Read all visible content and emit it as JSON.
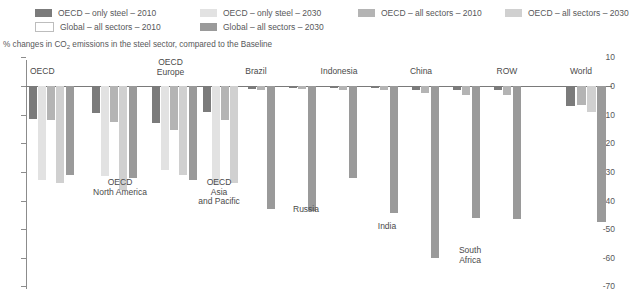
{
  "legend": {
    "items": [
      {
        "label": "OECD – only steel – 2010",
        "color": "#7b7b7b",
        "row": 1,
        "x": 35
      },
      {
        "label": "OECD – only steel – 2030",
        "color": "#e2e2e2",
        "row": 1,
        "x": 200
      },
      {
        "label": "OECD – all sectors – 2010",
        "color": "#b4b4b4",
        "row": 1,
        "x": 358
      },
      {
        "label": "OECD – all sectors – 2030",
        "color": "#d0d0d0",
        "row": 1,
        "x": 505
      },
      {
        "label": "Global – all sectors – 2010",
        "color": "#ffffff",
        "row": 2,
        "x": 35
      },
      {
        "label": "Global – all sectors – 2030",
        "color": "#9a9a9a",
        "row": 2,
        "x": 200
      }
    ]
  },
  "subtitle_pre": "% changes in CO",
  "subtitle_sub": "2",
  "subtitle_post": " emissions in the steel sector, compared to the Baseline",
  "chart_data": {
    "type": "bar",
    "title": "% changes in CO2 emissions in the steel sector, compared to the Baseline",
    "xlabel": "",
    "ylabel": "",
    "ylim": [
      -70,
      10
    ],
    "grid": false,
    "legend_position": "top",
    "yticks": [
      10,
      0,
      -10,
      -20,
      -30,
      -40,
      -50,
      -60,
      -70
    ],
    "ytick_labels": [
      "10",
      "0",
      "-10",
      "-20",
      "-30",
      "-40",
      "-50",
      "-60",
      "-70"
    ],
    "categories": [
      "OECD",
      "OECD\nNorth America",
      "OECD\nEurope",
      "OECD\nAsia\nand Pacific",
      "Brazil",
      "Russia",
      "Indonesia",
      "India",
      "China",
      "South\nAfrica",
      "ROW",
      "World"
    ],
    "series": [
      {
        "name": "OECD – only steel – 2010",
        "color": "#7b7b7b",
        "values": [
          -11.5,
          -9.5,
          -13.0,
          -9.0,
          -0.6,
          0.0,
          -0.5,
          0.0,
          -0.5,
          0.0,
          -0.4,
          -7.0
        ]
      },
      {
        "name": "OECD – only steel – 2030",
        "color": "#e2e2e2",
        "values": [
          -33.0,
          -31.5,
          -29.5,
          -34.5,
          -0.3,
          0.0,
          -0.2,
          0.0,
          -0.3,
          0.0,
          -0.3,
          -2.5
        ]
      },
      {
        "name": "OECD – all sectors – 2010",
        "color": "#b4b4b4",
        "values": [
          -12.0,
          -12.5,
          -15.5,
          -12.0,
          -0.8,
          0.0,
          -0.7,
          0.0,
          -0.6,
          0.0,
          -1.5,
          -6.5
        ]
      },
      {
        "name": "OECD – all sectors – 2030",
        "color": "#d0d0d0",
        "values": [
          -34.0,
          -36.5,
          -31.0,
          -34.0,
          -0.5,
          0.0,
          -0.4,
          0.0,
          -0.5,
          0.0,
          -2.5,
          -9.0
        ]
      },
      {
        "name": "Global – all sectors – 2010",
        "color": "#ffffff",
        "values": [
          -31.0,
          -31.0,
          -31.0,
          -31.0,
          -43.0,
          0.0,
          -32.0,
          0.0,
          -60.0,
          0.0,
          -46.5,
          -47.5
        ]
      },
      {
        "name": "Global – all sectors – 2030",
        "color": "#9a9a9a",
        "values": [
          -31.0,
          -31.0,
          -31.0,
          -31.0,
          -43.0,
          0.0,
          -32.0,
          0.0,
          -60.0,
          0.0,
          -46.5,
          -47.5
        ]
      }
    ],
    "bars": [
      {
        "group": "OECD",
        "series": "OECD – only steel – 2010",
        "value": -11.5,
        "x": 29,
        "w": 8,
        "color": "#7b7b7b"
      },
      {
        "group": "OECD",
        "series": "OECD – only steel – 2030",
        "value": -33.0,
        "x": 38,
        "w": 8,
        "color": "#e2e2e2"
      },
      {
        "group": "OECD",
        "series": "OECD – all sectors – 2010",
        "value": -12.0,
        "x": 47,
        "w": 8,
        "color": "#b4b4b4"
      },
      {
        "group": "OECD",
        "series": "OECD – all sectors – 2030",
        "value": -34.0,
        "x": 56,
        "w": 8,
        "color": "#d0d0d0"
      },
      {
        "group": "OECD",
        "series": "Global – all sectors – 2030",
        "value": -31.0,
        "x": 66,
        "w": 8,
        "color": "#9a9a9a"
      },
      {
        "group": "OECD North America",
        "series": "OECD – only steel – 2010",
        "value": -9.5,
        "x": 92,
        "w": 8,
        "color": "#7b7b7b"
      },
      {
        "group": "OECD North America",
        "series": "OECD – only steel – 2030",
        "value": -31.5,
        "x": 101,
        "w": 8,
        "color": "#e2e2e2"
      },
      {
        "group": "OECD North America",
        "series": "OECD – all sectors – 2010",
        "value": -12.5,
        "x": 110,
        "w": 8,
        "color": "#b4b4b4"
      },
      {
        "group": "OECD North America",
        "series": "OECD – all sectors – 2030",
        "value": -36.5,
        "x": 119,
        "w": 8,
        "color": "#d0d0d0"
      },
      {
        "group": "OECD North America",
        "series": "Global – all sectors – 2030",
        "value": -32.0,
        "x": 129,
        "w": 8,
        "color": "#9a9a9a"
      },
      {
        "group": "OECD Europe",
        "series": "OECD – only steel – 2010",
        "value": -13.0,
        "x": 152,
        "w": 8,
        "color": "#7b7b7b"
      },
      {
        "group": "OECD Europe",
        "series": "OECD – only steel – 2030",
        "value": -29.5,
        "x": 161,
        "w": 8,
        "color": "#e2e2e2"
      },
      {
        "group": "OECD Europe",
        "series": "OECD – all sectors – 2010",
        "value": -15.5,
        "x": 170,
        "w": 8,
        "color": "#b4b4b4"
      },
      {
        "group": "OECD Europe",
        "series": "OECD – all sectors – 2030",
        "value": -31.0,
        "x": 179,
        "w": 8,
        "color": "#d0d0d0"
      },
      {
        "group": "OECD Europe",
        "series": "Global – all sectors – 2030",
        "value": -33.0,
        "x": 189,
        "w": 8,
        "color": "#9a9a9a"
      },
      {
        "group": "OECD Asia and Pacific",
        "series": "OECD – only steel – 2010",
        "value": -9.0,
        "x": 203,
        "w": 8,
        "color": "#7b7b7b"
      },
      {
        "group": "OECD Asia and Pacific",
        "series": "OECD – only steel – 2030",
        "value": -34.5,
        "x": 212,
        "w": 8,
        "color": "#e2e2e2"
      },
      {
        "group": "OECD Asia and Pacific",
        "series": "OECD – all sectors – 2010",
        "value": -12.0,
        "x": 221,
        "w": 8,
        "color": "#b4b4b4"
      },
      {
        "group": "OECD Asia and Pacific",
        "series": "OECD – all sectors – 2030",
        "value": -34.0,
        "x": 230,
        "w": 8,
        "color": "#d0d0d0"
      },
      {
        "group": "Brazil",
        "series": "OECD – only steel – 2010",
        "value": -1.0,
        "x": 248,
        "w": 8,
        "color": "#7b7b7b"
      },
      {
        "group": "Brazil",
        "series": "OECD – all sectors – 2010",
        "value": -1.5,
        "x": 257,
        "w": 8,
        "color": "#b4b4b4"
      },
      {
        "group": "Brazil",
        "series": "Global – all sectors – 2030",
        "value": -43.0,
        "x": 267,
        "w": 8,
        "color": "#9a9a9a"
      },
      {
        "group": "Russia",
        "series": "OECD – only steel – 2010",
        "value": -0.8,
        "x": 289,
        "w": 8,
        "color": "#7b7b7b"
      },
      {
        "group": "Russia",
        "series": "OECD – all sectors – 2010",
        "value": -1.2,
        "x": 298,
        "w": 8,
        "color": "#b4b4b4"
      },
      {
        "group": "Russia",
        "series": "Global – all sectors – 2030",
        "value": -43.5,
        "x": 308,
        "w": 8,
        "color": "#9a9a9a"
      },
      {
        "group": "Indonesia",
        "series": "OECD – only steel – 2010",
        "value": -0.8,
        "x": 330,
        "w": 8,
        "color": "#7b7b7b"
      },
      {
        "group": "Indonesia",
        "series": "OECD – all sectors – 2010",
        "value": -1.5,
        "x": 339,
        "w": 8,
        "color": "#b4b4b4"
      },
      {
        "group": "Indonesia",
        "series": "Global – all sectors – 2030",
        "value": -32.0,
        "x": 349,
        "w": 8,
        "color": "#9a9a9a"
      },
      {
        "group": "India",
        "series": "OECD – only steel – 2010",
        "value": -0.8,
        "x": 371,
        "w": 8,
        "color": "#7b7b7b"
      },
      {
        "group": "India",
        "series": "OECD – all sectors – 2010",
        "value": -1.3,
        "x": 380,
        "w": 8,
        "color": "#b4b4b4"
      },
      {
        "group": "India",
        "series": "Global – all sectors – 2030",
        "value": -44.5,
        "x": 390,
        "w": 8,
        "color": "#9a9a9a"
      },
      {
        "group": "China",
        "series": "OECD – only steel – 2010",
        "value": -1.3,
        "x": 412,
        "w": 8,
        "color": "#7b7b7b"
      },
      {
        "group": "China",
        "series": "OECD – all sectors – 2010",
        "value": -2.3,
        "x": 421,
        "w": 8,
        "color": "#b4b4b4"
      },
      {
        "group": "China",
        "series": "Global – all sectors – 2030",
        "value": -60.0,
        "x": 431,
        "w": 8,
        "color": "#9a9a9a"
      },
      {
        "group": "South Africa",
        "series": "OECD – only steel – 2010",
        "value": -1.5,
        "x": 453,
        "w": 8,
        "color": "#7b7b7b"
      },
      {
        "group": "South Africa",
        "series": "OECD – all sectors – 2010",
        "value": -3.0,
        "x": 462,
        "w": 8,
        "color": "#b4b4b4"
      },
      {
        "group": "South Africa",
        "series": "Global – all sectors – 2030",
        "value": -46.0,
        "x": 472,
        "w": 8,
        "color": "#9a9a9a"
      },
      {
        "group": "ROW",
        "series": "OECD – only steel – 2010",
        "value": -1.5,
        "x": 494,
        "w": 8,
        "color": "#7b7b7b"
      },
      {
        "group": "ROW",
        "series": "OECD – all sectors – 2010",
        "value": -3.0,
        "x": 503,
        "w": 8,
        "color": "#b4b4b4"
      },
      {
        "group": "ROW",
        "series": "Global – all sectors – 2030",
        "value": -46.5,
        "x": 513,
        "w": 8,
        "color": "#9a9a9a"
      },
      {
        "group": "World",
        "series": "OECD – only steel – 2010",
        "value": -7.0,
        "x": 566,
        "w": 9,
        "color": "#7b7b7b"
      },
      {
        "group": "World",
        "series": "OECD – all sectors – 2010",
        "value": -6.5,
        "x": 577,
        "w": 9,
        "color": "#b4b4b4"
      },
      {
        "group": "World",
        "series": "OECD – all sectors – 2030",
        "value": -9.0,
        "x": 587,
        "w": 9,
        "color": "#d0d0d0"
      },
      {
        "group": "World",
        "series": "Global – all sectors – 2030",
        "value": -47.5,
        "x": 597,
        "w": 9,
        "color": "#9a9a9a"
      }
    ],
    "group_labels": [
      {
        "text": "OECD",
        "x": 30,
        "y": 67,
        "w": 50,
        "align": "left"
      },
      {
        "text": "OECD\nNorth America",
        "x": 80,
        "y": 178,
        "w": 80,
        "align": "center"
      },
      {
        "text": "OECD\nEurope",
        "x": 138,
        "y": 58,
        "w": 65,
        "align": "center"
      },
      {
        "text": "OECD\nAsia\nand Pacific",
        "x": 188,
        "y": 178,
        "w": 62,
        "align": "center"
      },
      {
        "text": "Brazil",
        "x": 226,
        "y": 67,
        "w": 60,
        "align": "center"
      },
      {
        "text": "Russia",
        "x": 276,
        "y": 205,
        "w": 60,
        "align": "center"
      },
      {
        "text": "Indonesia",
        "x": 306,
        "y": 67,
        "w": 66,
        "align": "center"
      },
      {
        "text": "India",
        "x": 362,
        "y": 222,
        "w": 50,
        "align": "center"
      },
      {
        "text": "China",
        "x": 391,
        "y": 67,
        "w": 60,
        "align": "center"
      },
      {
        "text": "South\nAfrica",
        "x": 442,
        "y": 246,
        "w": 56,
        "align": "center"
      },
      {
        "text": "ROW",
        "x": 479,
        "y": 67,
        "w": 56,
        "align": "center"
      },
      {
        "text": "World",
        "x": 551,
        "y": 67,
        "w": 60,
        "align": "center"
      }
    ]
  }
}
